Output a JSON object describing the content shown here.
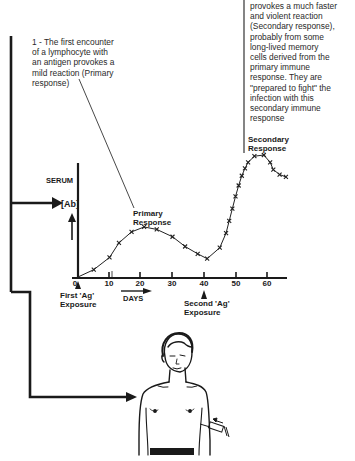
{
  "annotations": {
    "primary_note": "1 - The first encounter of a lymphocyte with an antigen provokes a mild reaction (Primary response)",
    "primary_note_lines": [
      "1 - The first encounter",
      "of a lymphocyte with",
      "an antigen provokes a",
      "mild reaction (Primary",
      "response)"
    ],
    "secondary_note_lines": [
      "provokes a much faster",
      "and violent reaction",
      "(Secondary response),",
      "probably from some",
      "long-lived memory",
      "cells derived from the",
      "primary immune",
      "response. They are",
      "\"prepared to fight\" the",
      "infection with this",
      "secondary immune",
      "response"
    ]
  },
  "chart_data": {
    "type": "line",
    "title": "",
    "ylabel_top": "SERUM",
    "ylabel": "[Ab]",
    "xlabel": "DAYS",
    "x_ticks": [
      0,
      10,
      20,
      30,
      40,
      50,
      60
    ],
    "x_tick_labels": [
      "0",
      "10",
      "20",
      "30",
      "40",
      "50",
      "60"
    ],
    "xlim": [
      0,
      68
    ],
    "ylim": [
      0,
      100
    ],
    "grid": false,
    "series": [
      {
        "name": "Serum antibody concentration",
        "marker": "x",
        "x": [
          0,
          5,
          10,
          13,
          17,
          21,
          25,
          30,
          34,
          38,
          41,
          45,
          47,
          48,
          49,
          50,
          51,
          52,
          53,
          54,
          56,
          59,
          61,
          62,
          64,
          66
        ],
        "y": [
          0,
          6,
          16,
          28,
          37,
          41,
          39,
          33,
          25,
          19,
          15,
          24,
          36,
          46,
          56,
          66,
          75,
          83,
          89,
          94,
          99,
          100,
          94,
          88,
          84,
          82
        ]
      }
    ],
    "annotations": [
      {
        "text": "Primary Response",
        "x": 21,
        "y": 41
      },
      {
        "text": "Secondary Response",
        "x": 59,
        "y": 100
      },
      {
        "text": "First 'Ag' Exposure",
        "x": 0,
        "marker": "up-arrow"
      },
      {
        "text": "Second 'Ag' Exposure",
        "x": 40,
        "marker": "up-arrow"
      }
    ]
  },
  "labels": {
    "serum": "SERUM",
    "ab": "[Ab]",
    "primary_response_1": "Primary",
    "primary_response_2": "Response",
    "secondary_response_1": "Secondary",
    "secondary_response_2": "Response",
    "first_exposure_1": "First 'Ag'",
    "first_exposure_2": "Exposure",
    "second_exposure_1": "Second 'Ag'",
    "second_exposure_2": "Exposure",
    "days": "DAYS"
  }
}
